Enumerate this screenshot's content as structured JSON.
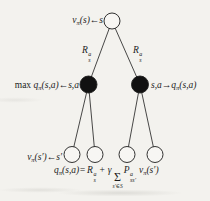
{
  "figure": {
    "kind": "rl-backup-diagram",
    "colors": {
      "background": "#f3f2ee",
      "ink": "#1c1c1c",
      "action_node_fill": "#111111",
      "state_node_fill": "#f7f6f3"
    },
    "labels": {
      "root": {
        "pre": "v",
        "sub": "π",
        "post": "(s)←s"
      },
      "reward_left": {
        "base": "R",
        "sup": "a",
        "sub": "s"
      },
      "reward_right": {
        "base": "R",
        "sup": "a",
        "sub": "s"
      },
      "action_left": {
        "max": "max ",
        "q": "q",
        "sub": "π",
        "post": "(s,a)←s,a"
      },
      "action_right": {
        "pre": "s,a→q",
        "sub": "π",
        "post": "(s,a)"
      },
      "next_state": {
        "pre": "v",
        "sub": "π",
        "post": "(s′)←s′"
      }
    },
    "equation": {
      "q": "q",
      "q_sub": "π",
      "lhs_rest": "(s,a)=",
      "R": "R",
      "R_sup": "a",
      "R_sub": "s",
      "plus": "+",
      "gamma": "γ",
      "sigma": "Σ",
      "sigma_under": "s′∈S",
      "P": "P",
      "P_sup": "a",
      "P_sub": "ss′",
      "v": "v",
      "v_sub": "π",
      "v_rest": "(s′)"
    }
  }
}
